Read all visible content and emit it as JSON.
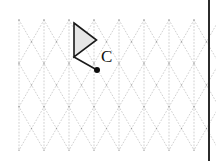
{
  "canvas": {
    "width": 216,
    "height": 161,
    "background": "#ffffff",
    "name": "triangular-dot-grid-worksheet"
  },
  "grid": {
    "type": "isometric-triangular",
    "line_style": "dotted",
    "line_color": "#bdbdbd",
    "node_color": "#9e9e9e",
    "origin_x": 19,
    "origin_y": 20,
    "column_spacing": 25,
    "row_spacing": 21.7,
    "columns": 8,
    "rows": 6,
    "show_vertical_lines": true,
    "show_diagonal_lines": true
  },
  "shape": {
    "name": "triangle",
    "fill": "#e6e6e6",
    "stroke": "#1a1a1a",
    "stroke_width": 1.6,
    "vertices": [
      {
        "x": 74,
        "y": 23
      },
      {
        "x": 96.5,
        "y": 40
      },
      {
        "x": 74,
        "y": 57
      }
    ]
  },
  "ray": {
    "name": "segment-to-center",
    "from": {
      "x": 74,
      "y": 57
    },
    "to": {
      "x": 97,
      "y": 70
    },
    "stroke": "#1a1a1a",
    "stroke_width": 1.5
  },
  "center_point": {
    "label": "C",
    "x": 97,
    "y": 70,
    "radius": 3,
    "color": "#0d0d0d",
    "label_x": 101,
    "label_y": 62
  },
  "border": {
    "side": "right",
    "x": 209,
    "color": "#2b2b2b",
    "width": 2
  }
}
